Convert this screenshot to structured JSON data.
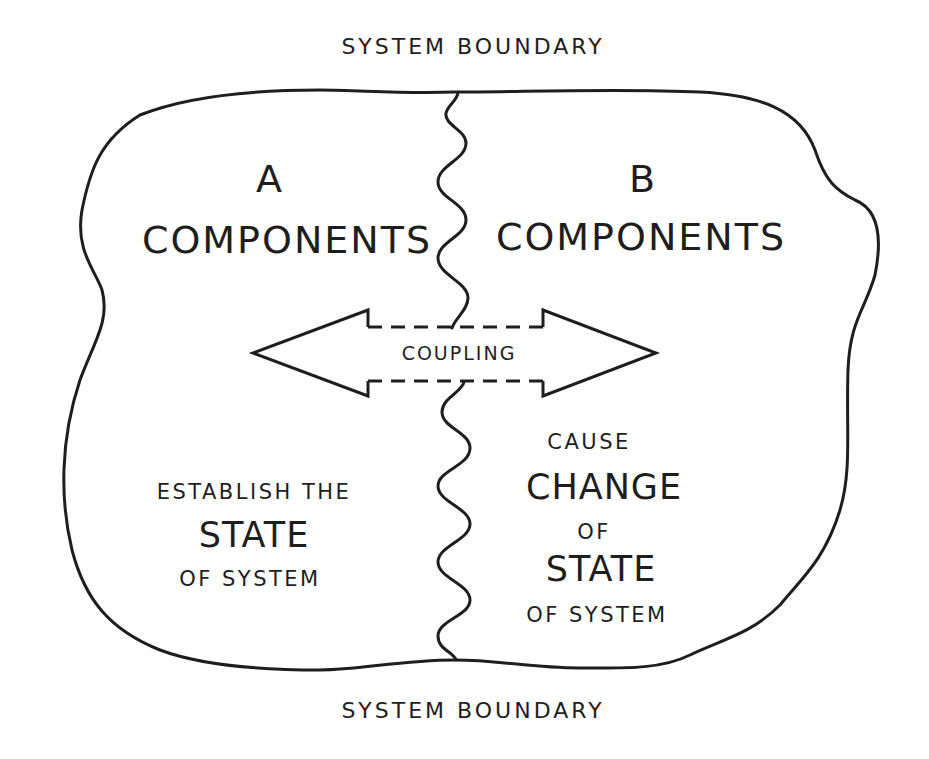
{
  "diagram": {
    "type": "system-boundary-diagram",
    "stroke_color": "#1e1e1e",
    "background_color": "#ffffff",
    "top_boundary_label": "SYSTEM BOUNDARY",
    "bottom_boundary_label": "SYSTEM BOUNDARY",
    "region_a": {
      "letter": "A",
      "title": "COMPONENTS",
      "description": {
        "line1": "ESTABLISH THE",
        "line2": "STATE",
        "line3": "OF SYSTEM"
      }
    },
    "region_b": {
      "letter": "B",
      "title": "COMPONENTS",
      "description": {
        "line1": "CAUSE",
        "line2": "CHANGE",
        "line3": "OF",
        "line4": "STATE",
        "line5": "OF SYSTEM"
      }
    },
    "coupling_arrow": {
      "label": "COUPLING",
      "direction": "bidirectional",
      "shaft_style": "dashed"
    }
  }
}
